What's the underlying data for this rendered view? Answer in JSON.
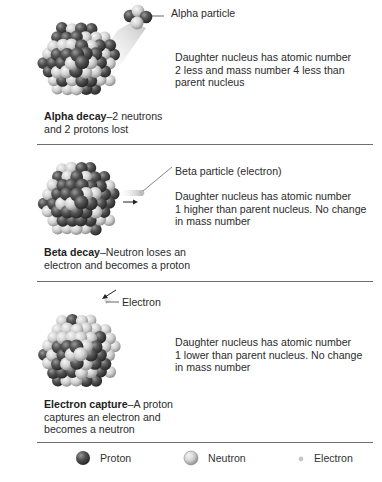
{
  "sections": [
    {
      "id": "alpha",
      "particle_label": "Alpha particle",
      "description": [
        "Daughter nucleus has atomic number",
        "2 less and mass number 4 less than",
        "parent nucleus"
      ],
      "caption_bold": "Alpha decay",
      "caption_rest": [
        "–2 neutrons",
        "and 2 protons lost"
      ]
    },
    {
      "id": "beta",
      "particle_label": "Beta particle (electron)",
      "description": [
        "Daughter nucleus has atomic number",
        "1 higher than parent nucleus. No change",
        "in mass number"
      ],
      "caption_bold": "Beta decay",
      "caption_rest": [
        "–Neutron loses an",
        "electron and becomes a proton"
      ]
    },
    {
      "id": "electron-capture",
      "particle_label": "Electron",
      "description": [
        "Daughter nucleus has atomic number",
        "1 lower than parent nucleus. No change",
        "in mass number"
      ],
      "caption_bold": "Electron capture",
      "caption_rest": [
        "–A proton",
        "captures an electron and",
        "becomes a neutron"
      ]
    }
  ],
  "legend": [
    {
      "label": "Proton",
      "icon": "proton-sphere-icon",
      "color": "#4a4a4a"
    },
    {
      "label": "Neutron",
      "icon": "neutron-sphere-icon",
      "color": "#d8d8d8"
    },
    {
      "label": "Electron",
      "icon": "electron-dot-icon",
      "color": "#c8c8c8"
    }
  ],
  "colors": {
    "proton": "#4a4a4a",
    "neutron": "#d4d4d4",
    "divider": "#6e6e6e",
    "text": "#2b2b2b"
  }
}
